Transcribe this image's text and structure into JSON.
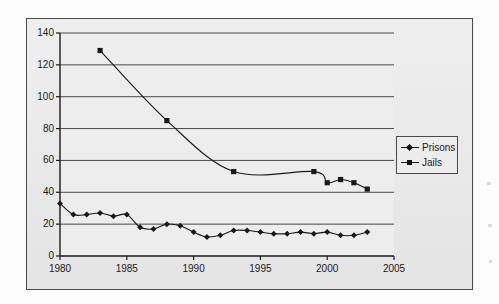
{
  "figure": {
    "frame_color": "#4a4a4a",
    "plot_background": "#e9e9e9",
    "line_color": "#1a1a1a"
  },
  "legend": {
    "position": "right",
    "items": [
      {
        "label": "Prisons",
        "marker": "diamond"
      },
      {
        "label": "Jails",
        "marker": "square"
      }
    ]
  },
  "axes": {
    "y_ticks": [
      "0",
      "20",
      "40",
      "60",
      "80",
      "100",
      "120",
      "140"
    ],
    "x_ticks": [
      "1980",
      "1985",
      "1990",
      "1995",
      "2000",
      "2005"
    ]
  },
  "chart_data": {
    "type": "line",
    "title": "",
    "subtitle": "",
    "xlabel": "",
    "ylabel": "",
    "xlim": [
      1980,
      2005
    ],
    "ylim": [
      0,
      140
    ],
    "y_ticks": [
      0,
      20,
      40,
      60,
      80,
      100,
      120,
      140
    ],
    "x_ticks": [
      1980,
      1985,
      1990,
      1995,
      2000,
      2005
    ],
    "grid": "horizontal",
    "legend_position": "right",
    "series": [
      {
        "name": "Prisons",
        "marker": "diamond",
        "x": [
          1980,
          1981,
          1982,
          1983,
          1984,
          1985,
          1986,
          1987,
          1988,
          1989,
          1990,
          1991,
          1992,
          1993,
          1994,
          1995,
          1996,
          1997,
          1998,
          1999,
          2000,
          2001,
          2002,
          2003
        ],
        "values": [
          33,
          26,
          26,
          27,
          25,
          26,
          18,
          17,
          20,
          19,
          15,
          12,
          13,
          16,
          16,
          15,
          14,
          14,
          15,
          14,
          15,
          13,
          13,
          15
        ]
      },
      {
        "name": "Jails",
        "marker": "square",
        "x": [
          1983,
          1988,
          1993,
          1999,
          2000,
          2001,
          2002,
          2003
        ],
        "values": [
          129,
          85,
          53,
          53,
          46,
          48,
          46,
          42
        ]
      }
    ]
  }
}
